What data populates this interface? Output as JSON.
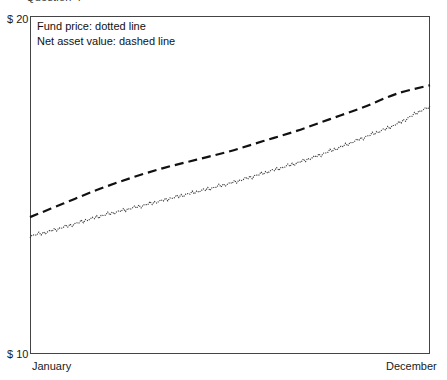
{
  "heading": {
    "text": "Question 4",
    "note": "cut off at top edge of screenshot"
  },
  "axes": {
    "y_max_label": "$ 20",
    "y_min_label": "$ 10",
    "x_min_label": "January",
    "x_max_label": "December"
  },
  "legend": {
    "line1": "Fund price: dotted line",
    "line2": "Net asset value: dashed line"
  },
  "chart_data": {
    "type": "line",
    "title": "",
    "xlabel": "",
    "ylabel": "",
    "ylim": [
      10,
      20
    ],
    "ytick_labels": [
      "$ 10",
      "$ 20"
    ],
    "xtick_labels": [
      "January",
      "December"
    ],
    "grid": false,
    "legend_position": "top-left-inside",
    "x": [
      0,
      1,
      2,
      3,
      4,
      5,
      6,
      7,
      8,
      9,
      10,
      11,
      12
    ],
    "x_categories": [
      "January",
      "February",
      "March",
      "April",
      "May",
      "June",
      "July",
      "August",
      "September",
      "October",
      "November",
      "December"
    ],
    "series": [
      {
        "name": "Net asset value",
        "style": "dashed",
        "color": "#111111",
        "values": [
          14.05,
          14.45,
          14.85,
          15.2,
          15.5,
          15.75,
          16.0,
          16.3,
          16.6,
          16.95,
          17.3,
          17.7,
          17.95
        ]
      },
      {
        "name": "Fund price",
        "style": "dotted",
        "color": "#333333",
        "values": [
          13.5,
          13.75,
          14.05,
          14.3,
          14.55,
          14.8,
          15.05,
          15.35,
          15.65,
          16.0,
          16.4,
          16.8,
          17.3
        ]
      }
    ]
  }
}
